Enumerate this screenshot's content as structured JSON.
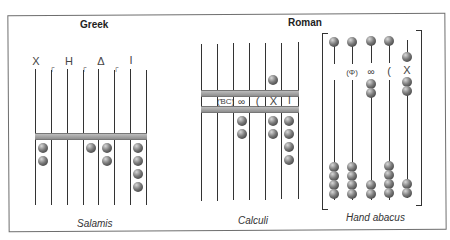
{
  "figure": {
    "titles": {
      "greek": "Greek",
      "roman": "Roman"
    },
    "captions": {
      "salamis": "Salamis",
      "calculi": "Calculi",
      "hand_abacus": "Hand abacus"
    },
    "salamis": {
      "symbols": [
        "X",
        "┌",
        "H",
        "┌",
        "Δ",
        "┌",
        "I"
      ],
      "rods": 8,
      "beads_below_bar": [
        2,
        0,
        0,
        1,
        2,
        0,
        4
      ]
    },
    "calculi": {
      "symbols": [
        "(ƁC)",
        "∞",
        "(",
        "X",
        "I"
      ],
      "rods": 7,
      "beads_above_bar": [
        0,
        0,
        0,
        0,
        1,
        0
      ],
      "beads_below_bar": [
        0,
        0,
        2,
        0,
        2,
        4
      ]
    },
    "hand_abacus": {
      "symbols": [
        "",
        "(Φ)",
        "∞",
        "(",
        "X"
      ],
      "rods": 5,
      "upper_beads": [
        1,
        1,
        1,
        1,
        1
      ],
      "middle_beads": [
        0,
        0,
        2,
        0,
        2
      ],
      "lower_beads": [
        4,
        4,
        2,
        4,
        2
      ]
    },
    "colors": {
      "bead": "#4a4a4a",
      "bar": "#a8a8a8",
      "line": "#333333"
    }
  }
}
